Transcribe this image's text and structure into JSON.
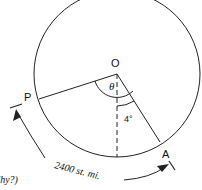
{
  "diagram": {
    "points": {
      "center": "O",
      "left": "P",
      "right": "A"
    },
    "angles": {
      "theta": "θ",
      "small": "4°"
    },
    "arc_label": "2400 st. mi.",
    "partial_text": "'hy?)",
    "colors": {
      "stroke": "#222222",
      "background": "#ffffff"
    }
  }
}
